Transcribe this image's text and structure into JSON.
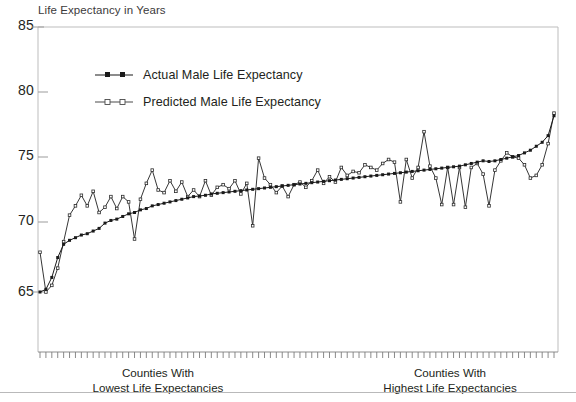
{
  "chart_data": {
    "type": "line",
    "title": "Life Expectancy in Years",
    "ylabel": "Life Expectancy in Years",
    "xlabel": "",
    "ylim": [
      62.5,
      85
    ],
    "yticks": [
      65,
      70,
      75,
      80,
      85
    ],
    "ytick_labels": [
      "65",
      "70",
      "75",
      "80",
      "85"
    ],
    "grid": false,
    "legend_position": "top-left-inside",
    "x_axis_note": "Counties ordered from lowest to highest life expectancy; ~88 tick marks, no numeric x labels",
    "x_caption_left": {
      "line1": "Counties With",
      "line2": "Lowest Life Expectancies"
    },
    "x_caption_right": {
      "line1": "Counties With",
      "line2": "Highest Life Expectancies"
    },
    "series": [
      {
        "name": "Actual Male Life Expectancy",
        "marker": "filled-square",
        "color": "#1a1a1a",
        "values": [
          65.0,
          65.2,
          66.1,
          67.6,
          68.6,
          68.9,
          69.1,
          69.3,
          69.4,
          69.6,
          69.8,
          70.2,
          70.4,
          70.5,
          70.7,
          70.9,
          71.0,
          71.2,
          71.3,
          71.5,
          71.6,
          71.7,
          71.8,
          71.9,
          72.0,
          72.1,
          72.2,
          72.25,
          72.3,
          72.4,
          72.45,
          72.5,
          72.55,
          72.6,
          72.65,
          72.7,
          72.75,
          72.8,
          72.85,
          72.9,
          72.95,
          73.0,
          73.05,
          73.1,
          73.15,
          73.2,
          73.25,
          73.3,
          73.35,
          73.4,
          73.45,
          73.5,
          73.55,
          73.6,
          73.65,
          73.7,
          73.75,
          73.8,
          73.85,
          73.9,
          73.95,
          74.0,
          74.05,
          74.1,
          74.15,
          74.2,
          74.25,
          74.3,
          74.35,
          74.4,
          74.45,
          74.5,
          74.6,
          74.7,
          74.8,
          74.9,
          74.85,
          74.9,
          75.0,
          75.1,
          75.2,
          75.3,
          75.5,
          75.7,
          76.0,
          76.3,
          76.8,
          78.3
        ]
      },
      {
        "name": "Predicted Male Life Expectancy",
        "marker": "open-square",
        "color": "#2b2b2b",
        "values": [
          68.0,
          65.0,
          65.5,
          66.8,
          68.8,
          70.8,
          71.5,
          72.3,
          71.5,
          72.6,
          71.0,
          71.4,
          72.2,
          71.3,
          72.2,
          71.8,
          69.0,
          72.0,
          73.2,
          74.2,
          72.7,
          72.5,
          73.4,
          72.6,
          73.3,
          72.2,
          72.7,
          72.2,
          73.4,
          72.3,
          72.9,
          73.1,
          72.8,
          73.4,
          72.4,
          73.2,
          70.0,
          75.1,
          73.6,
          73.1,
          72.5,
          73.0,
          72.2,
          73.1,
          73.3,
          72.9,
          73.4,
          74.2,
          73.2,
          73.7,
          73.3,
          74.4,
          73.8,
          74.1,
          74.0,
          74.6,
          74.4,
          74.2,
          74.7,
          75.0,
          74.8,
          71.8,
          75.0,
          73.6,
          74.4,
          77.1,
          74.5,
          73.6,
          71.6,
          74.4,
          71.6,
          74.4,
          71.4,
          74.4,
          74.7,
          73.9,
          71.5,
          74.2,
          74.9,
          75.5,
          75.2,
          75.1,
          74.6,
          73.6,
          73.8,
          74.6,
          76.2,
          78.5
        ]
      }
    ]
  },
  "legend": {
    "items": [
      {
        "label": "Actual Male Life Expectancy",
        "marker": "filled-square"
      },
      {
        "label": "Predicted Male Life Expectancy",
        "marker": "open-square"
      }
    ]
  }
}
